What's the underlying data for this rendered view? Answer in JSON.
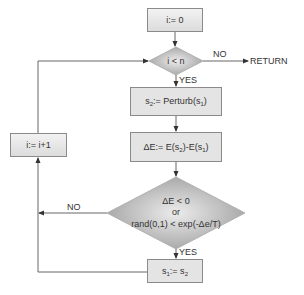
{
  "diagram": {
    "type": "flowchart",
    "title": "",
    "nodes": {
      "init": {
        "label": "i:= 0",
        "shape": "rectangle"
      },
      "loop_check": {
        "label": "i < n",
        "shape": "diamond"
      },
      "perturb": {
        "label_prefix": "s",
        "label_sub1": "2",
        "label_mid": ":= Perturb(s",
        "label_sub2": "1",
        "label_suffix": ")",
        "text": "s2:= Perturb(s1)",
        "shape": "rectangle"
      },
      "delta": {
        "label_prefix": "ΔE:= E(s",
        "label_sub1": "2",
        "label_mid": ")-E(s",
        "label_sub2": "1",
        "label_suffix": ")",
        "text": "ΔE:= E(s2)-E(s1)",
        "shape": "rectangle"
      },
      "accept_check": {
        "line1": "ΔE < 0",
        "line2": "or",
        "line3": "rand(0,1) < exp(-Δe/T)",
        "shape": "diamond"
      },
      "accept": {
        "label_prefix": "s",
        "label_sub1": "1",
        "label_mid": ":= s",
        "label_sub2": "2",
        "text": "s1:= s2",
        "shape": "rectangle"
      },
      "increment": {
        "label": "i:= i+1",
        "shape": "rectangle"
      },
      "return": {
        "label": "RETURN",
        "shape": "terminal-text"
      }
    },
    "edge_labels": {
      "loop_no": "NO",
      "loop_yes": "YES",
      "accept_no": "NO",
      "accept_yes": "YES"
    },
    "colors": {
      "line": "#666666",
      "box_fill": "#e4e4e4",
      "diamond_edge": "#9a9a9a",
      "diamond_center": "#e8e8e8",
      "text": "#333333"
    }
  }
}
